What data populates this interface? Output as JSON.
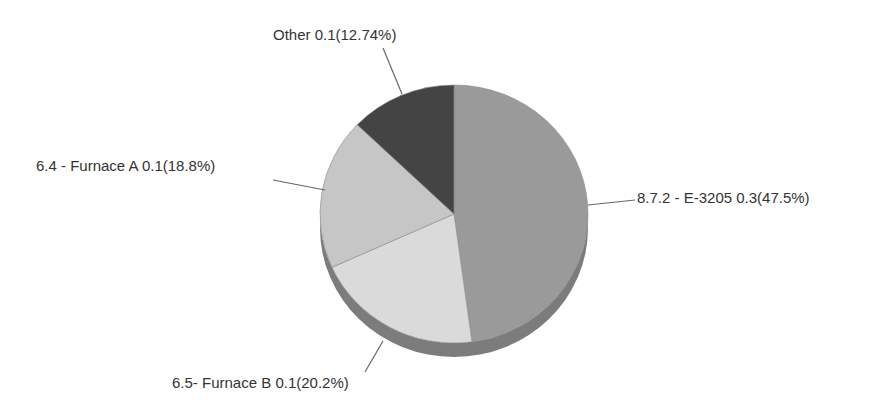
{
  "chart_data": {
    "type": "pie",
    "title": "",
    "style": "3d",
    "start_angle_deg": 0,
    "direction": "clockwise",
    "slices": [
      {
        "label": "8.7.2 - E-3205",
        "value": 0.3,
        "percent": 47.5,
        "color": "#9a9a9a",
        "display": "8.7.2 - E-3205 0.3(47.5%)"
      },
      {
        "label": "6.5- Furnace B",
        "value": 0.1,
        "percent": 20.2,
        "color": "#dadada",
        "display": "6.5- Furnace B 0.1(20.2%)"
      },
      {
        "label": "6.4 - Furnace A",
        "value": 0.1,
        "percent": 18.8,
        "color": "#c6c6c6",
        "display": "6.4 - Furnace A 0.1(18.8%)"
      },
      {
        "label": "Other",
        "value": 0.1,
        "percent": 12.74,
        "color": "#444444",
        "display": "Other 0.1(12.74%)"
      }
    ],
    "legend": "none",
    "labels": "outside-with-leader-lines"
  },
  "geometry": {
    "cx": 454,
    "cy": 214,
    "rx": 134,
    "ry": 129,
    "depth": 14,
    "side_color": "#7c7c7c",
    "leader_color": "#666666"
  },
  "labels": {
    "e3205": {
      "text": "8.7.2 - E-3205 0.3(47.5%)",
      "x": 637,
      "y": 189,
      "line": [
        588,
        205,
        635,
        200
      ]
    },
    "furnaceB": {
      "text": "6.5- Furnace B 0.1(20.2%)",
      "x": 172,
      "y": 374,
      "line": [
        383,
        341,
        365,
        372
      ]
    },
    "furnaceA": {
      "text": "6.4 - Furnace A 0.1(18.8%)",
      "x": 36,
      "y": 157,
      "line": [
        325,
        190,
        273,
        180
      ]
    },
    "other": {
      "text": "Other 0.1(12.74%)",
      "x": 273,
      "y": 26,
      "line": [
        402,
        94,
        383,
        48
      ]
    }
  }
}
